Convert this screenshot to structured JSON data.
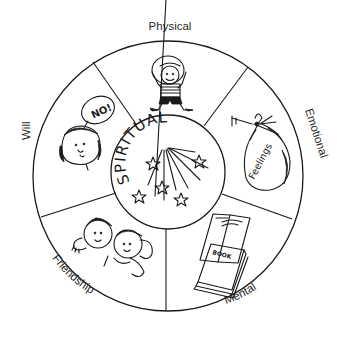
{
  "diagram": {
    "type": "wheel",
    "center_label": "SPIRITUAL",
    "segments": [
      {
        "id": "physical",
        "label": "Physical",
        "illustration": "child-in-striped-shirt-waving"
      },
      {
        "id": "emotional",
        "label": "Emotional",
        "illustration": "tied-bag",
        "illustration_text": "Feelings"
      },
      {
        "id": "mental",
        "label": "Mental",
        "illustration": "books",
        "illustration_text": "BOOK"
      },
      {
        "id": "friendship",
        "label": "Friendship",
        "illustration": "two-children-hugging"
      },
      {
        "id": "will",
        "label": "Will",
        "illustration": "child-with-speech-bubble",
        "illustration_text": "NO!"
      }
    ],
    "center_decoration": "stars-and-light-rays",
    "colors": {
      "line": "#1a1a1a",
      "label": "#2a2a2a",
      "background": "#ffffff"
    }
  }
}
